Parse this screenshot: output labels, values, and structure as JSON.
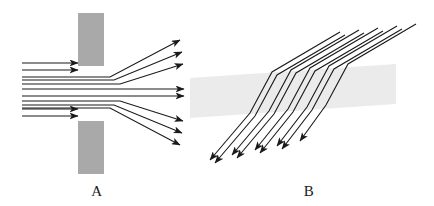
{
  "figure": {
    "background_color": "#ffffff",
    "ray_color": "#1a1a1a",
    "ray_width": 1.1,
    "width": 434,
    "height": 206
  },
  "panel_a": {
    "label": "A",
    "label_x": 97,
    "label_y": 196,
    "description": "Parallel rays travel rightward, pass through a narrow slit in an opaque barrier and fan out radially on the far side.",
    "barrier": {
      "name": "opaque-barrier",
      "color": "#a9a9a9",
      "x": 78,
      "width": 26,
      "upper_y": 13,
      "upper_height": 53,
      "lower_y": 121,
      "lower_height": 53,
      "slit_top": 66,
      "slit_bottom": 121,
      "slit_center_y": 93.5
    },
    "incoming_rays": {
      "name": "incoming-plane-wave-rays",
      "count": 8,
      "x_start": 22,
      "y_values": [
        63,
        70,
        77,
        85,
        93,
        101,
        109,
        116
      ],
      "blocked_indices": [
        0,
        1,
        6,
        7
      ],
      "blocked_x_end": 78,
      "passing_x_end": 104
    },
    "outgoing_rays": {
      "name": "fanned-output-rays",
      "count": 8,
      "pivot_x": 104,
      "spread_origin_y": 93.5,
      "tip_x_values": [
        180,
        182,
        183,
        184,
        184,
        183,
        182,
        180
      ],
      "tip_y_values": [
        40,
        52,
        64,
        84,
        94,
        112,
        126,
        140
      ],
      "bend_x_values": [
        110,
        112,
        116,
        128,
        134,
        120,
        116,
        112
      ]
    }
  },
  "panel_b": {
    "label": "B",
    "label_x": 309,
    "label_y": 196,
    "description": "Parallel rays enter a transparent slab obliquely from upper right, bend inside the slab, then resume their original direction toward lower left.",
    "slab": {
      "name": "transparent-slab",
      "color": "#ebebeb",
      "points": "190,78 396,64 396,104 190,118",
      "top_left_x": 190,
      "top_left_y": 78,
      "top_right_x": 396,
      "top_right_y": 64,
      "bottom_right_x": 396,
      "bottom_right_y": 104,
      "bottom_left_x": 190,
      "bottom_left_y": 118
    },
    "rays": {
      "name": "refracted-rays",
      "count": 5,
      "direction": "upper-right to lower-left",
      "entry_points_x": [
        416,
        397,
        378,
        359,
        340
      ],
      "entry_points_y": [
        24,
        26,
        28,
        30,
        32
      ],
      "arrow_tips_x": [
        210,
        232,
        255,
        277,
        300
      ],
      "arrow_tips_y": [
        160,
        158,
        156,
        154,
        152
      ],
      "pair_offset": 5
    }
  }
}
